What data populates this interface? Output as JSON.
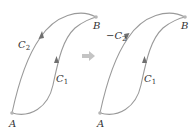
{
  "colors": {
    "curve": "#9a9a9a",
    "point": "#b5b5b5",
    "arrowhead": "#6f6f6f",
    "transform_arrow": "#c4c4c4",
    "label": "#333333"
  },
  "left_panel": {
    "point_a_label": "A",
    "point_b_label": "B",
    "curve_upper": {
      "label": "C",
      "subscript": "2",
      "direction": "A to B"
    },
    "curve_lower": {
      "label": "C",
      "subscript": "1",
      "direction": "A to B"
    }
  },
  "transform_arrow": {
    "icon": "right-arrow-icon"
  },
  "right_panel": {
    "point_a_label": "A",
    "point_b_label": "B",
    "curve_upper": {
      "label": "−C",
      "subscript": "2",
      "direction": "B to A"
    },
    "curve_lower": {
      "label": "C",
      "subscript": "1",
      "direction": "A to B"
    }
  }
}
